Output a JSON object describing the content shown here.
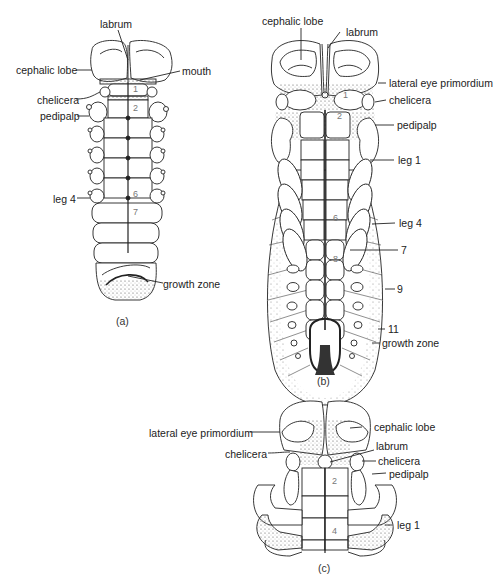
{
  "figure": {
    "panels": [
      {
        "id": "a",
        "caption": "(a)",
        "labels": {
          "labrum": "labrum",
          "cephalic_lobe": "cephalic lobe",
          "mouth": "mouth",
          "chelicera": "chelicera",
          "pedipalp": "pedipalp",
          "leg4": "leg 4",
          "growth_zone": "growth zone"
        },
        "segment_numbers": [
          "1",
          "2",
          "6",
          "7"
        ]
      },
      {
        "id": "b",
        "caption": "(b)",
        "labels": {
          "cephalic_lobe": "cephalic lobe",
          "labrum": "labrum",
          "lateral_eye": "lateral eye primordium",
          "chelicera": "chelicera",
          "pedipalp": "pedipalp",
          "leg1": "leg 1",
          "leg4": "leg 4",
          "seg7": "7",
          "seg9": "9",
          "seg11": "11",
          "growth_zone": "growth zone"
        },
        "segment_numbers": [
          "1",
          "2",
          "6",
          "8"
        ]
      },
      {
        "id": "c",
        "caption": "(c)",
        "labels": {
          "lateral_eye": "lateral eye primordium",
          "cephalic_lobe": "cephalic lobe",
          "labrum": "labrum",
          "chelicera_left": "chelicera",
          "chelicera_right": "chelicera",
          "pedipalp": "pedipalp",
          "leg1": "leg 1"
        },
        "segment_numbers": [
          "2",
          "4"
        ]
      }
    ]
  }
}
